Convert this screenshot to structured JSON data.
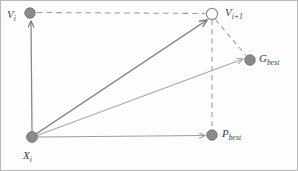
{
  "figure": {
    "name": "pso-velocity-update-diagram",
    "type": "vector-diagram",
    "background_color": "#fdfdfd",
    "border_color": "#b9b9b9",
    "width": 298,
    "height": 171
  },
  "style": {
    "node_fill": "#8a8a8a",
    "node_stroke": "#6e6e6e",
    "hollow_fill": "#ffffff",
    "arrow_dark": "#787878",
    "arrow_light": "#a8a8a8",
    "dash_color": "#9a9a9a",
    "label_color": "#3b3b3b"
  },
  "nodes": [
    {
      "id": "vi",
      "label_base": "V",
      "label_sub": "i",
      "x": 29,
      "y": 12,
      "r": 5.2,
      "filled": true,
      "label_position": "left"
    },
    {
      "id": "vi1",
      "label_base": "V",
      "label_sub": "i+1",
      "x": 211,
      "y": 13,
      "r": 5.6,
      "filled": false,
      "label_position": "right"
    },
    {
      "id": "gbest",
      "label_base": "G",
      "label_sub": "best",
      "x": 249,
      "y": 59,
      "r": 5.2,
      "filled": true,
      "label_position": "right"
    },
    {
      "id": "pbest",
      "label_base": "P",
      "label_sub": "best",
      "x": 211,
      "y": 134,
      "r": 5.2,
      "filled": true,
      "label_position": "right"
    },
    {
      "id": "xi",
      "label_base": "X",
      "label_sub": "i",
      "x": 31,
      "y": 136,
      "r": 5.4,
      "filled": true,
      "label_position": "below"
    }
  ],
  "edges": [
    {
      "id": "xi-to-vi",
      "from": "xi",
      "to": "vi",
      "style": "solid",
      "arrow": true,
      "weight": "dark",
      "description": "inertia velocity vector"
    },
    {
      "id": "xi-to-vi1",
      "from": "xi",
      "to": "vi1",
      "style": "solid",
      "arrow": true,
      "weight": "dark",
      "description": "resultant new velocity vector"
    },
    {
      "id": "xi-to-gbest",
      "from": "xi",
      "to": "gbest",
      "style": "solid",
      "arrow": true,
      "weight": "light",
      "description": "social component toward global best"
    },
    {
      "id": "xi-to-pbest",
      "from": "xi",
      "to": "pbest",
      "style": "solid",
      "arrow": true,
      "weight": "light",
      "description": "cognitive component toward personal best"
    },
    {
      "id": "vi-to-vi1",
      "from": "vi",
      "to": "vi1",
      "style": "dashed",
      "arrow": false,
      "weight": "dash",
      "description": "horizontal construction line"
    },
    {
      "id": "vi1-to-gbest",
      "from": "vi1",
      "to": "gbest",
      "style": "dashed",
      "arrow": false,
      "weight": "dash",
      "description": "diagonal construction line"
    },
    {
      "id": "vi1-to-pbest",
      "from": "vi1",
      "to": "pbest",
      "style": "dashed",
      "arrow": false,
      "weight": "dash",
      "description": "vertical construction line"
    }
  ],
  "labels": {
    "vi": {
      "base": "V",
      "sub": "i"
    },
    "vi1": {
      "base": "V",
      "sub": "i+1"
    },
    "gbest": {
      "base": "G",
      "sub": "best"
    },
    "pbest": {
      "base": "P",
      "sub": "best"
    },
    "xi": {
      "base": "X",
      "sub": "i"
    }
  }
}
